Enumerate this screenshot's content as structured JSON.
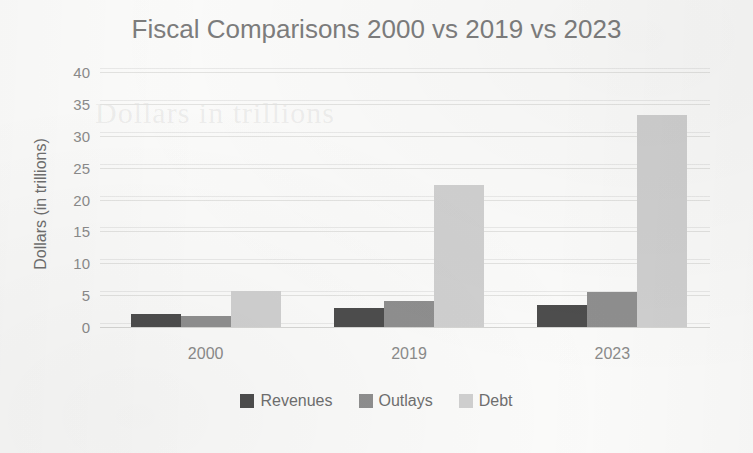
{
  "chart_data": {
    "type": "bar",
    "title": "Fiscal Comparisons 2000 vs 2019 vs 2023",
    "xlabel": "",
    "ylabel": "Dollars (in trillions)",
    "categories": [
      "2000",
      "2019",
      "2023"
    ],
    "series": [
      {
        "name": "Revenues",
        "color": "#4d4d4d",
        "values": [
          2.0,
          3.0,
          3.5
        ]
      },
      {
        "name": "Outlays",
        "color": "#8f8f8f",
        "values": [
          1.8,
          4.1,
          5.5
        ]
      },
      {
        "name": "Debt",
        "color": "#d0d0d0",
        "values": [
          5.6,
          22.2,
          33.3
        ]
      }
    ],
    "ylim": [
      0,
      40
    ],
    "y_ticks": [
      0,
      5,
      10,
      15,
      20,
      25,
      30,
      35,
      40
    ],
    "y_tick_labels": [
      "0",
      "5",
      "10",
      "15",
      "20",
      "25",
      "30",
      "35",
      "40"
    ],
    "grid": true,
    "grid_axis": "y",
    "legend_position": "bottom"
  },
  "background": {
    "bleed_text": "Dollars in trillions"
  }
}
